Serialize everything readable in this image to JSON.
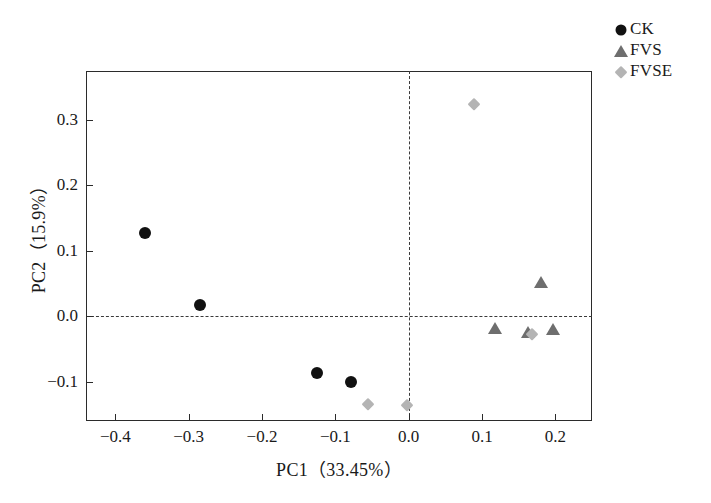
{
  "chart_data": {
    "type": "scatter",
    "title": "",
    "xlabel": "PC1（33.45%）",
    "ylabel": "PC2（15.9%）",
    "xlim": [
      -0.44,
      0.25
    ],
    "ylim": [
      -0.16,
      0.375
    ],
    "xticks": [
      -0.4,
      -0.3,
      -0.2,
      -0.1,
      0.0,
      0.1,
      0.2
    ],
    "xticklabels": [
      "−0.4",
      "−0.3",
      "−0.2",
      "−0.1",
      "0.0",
      "0.1",
      "0.2"
    ],
    "yticks": [
      0.3,
      0.2,
      0.1,
      0.0,
      -0.1
    ],
    "yticklabels": [
      "0.3",
      "0.2",
      "0.1",
      "0.0",
      "−0.1"
    ],
    "grid": false,
    "reference_lines": {
      "horizontal": 0.0,
      "vertical": 0.0,
      "style": "dashed"
    },
    "legend_position": "top-right",
    "series": [
      {
        "name": "CK",
        "marker": "circle",
        "color": "#111111",
        "points": [
          {
            "x": -0.36,
            "y": 0.128
          },
          {
            "x": -0.285,
            "y": 0.018
          },
          {
            "x": -0.125,
            "y": -0.086
          },
          {
            "x": -0.078,
            "y": -0.1
          }
        ]
      },
      {
        "name": "FVS",
        "marker": "triangle",
        "color": "#6e6e6e",
        "points": [
          {
            "x": 0.18,
            "y": 0.052
          },
          {
            "x": 0.118,
            "y": -0.018
          },
          {
            "x": 0.163,
            "y": -0.024
          },
          {
            "x": 0.197,
            "y": -0.019
          }
        ]
      },
      {
        "name": "FVSE",
        "marker": "diamond",
        "color": "#b4b4b4",
        "points": [
          {
            "x": 0.089,
            "y": 0.325
          },
          {
            "x": 0.168,
            "y": -0.027
          },
          {
            "x": -0.055,
            "y": -0.134
          },
          {
            "x": -0.002,
            "y": -0.135
          }
        ]
      }
    ]
  },
  "legend": {
    "items": [
      {
        "label": "CK",
        "marker": "circle",
        "color": "#111111"
      },
      {
        "label": "FVS",
        "marker": "triangle",
        "color": "#6e6e6e"
      },
      {
        "label": "FVSE",
        "marker": "diamond",
        "color": "#b4b4b4"
      }
    ]
  },
  "axes": {
    "x_title": "PC1（33.45%）",
    "y_title": "PC2（15.9%）"
  }
}
